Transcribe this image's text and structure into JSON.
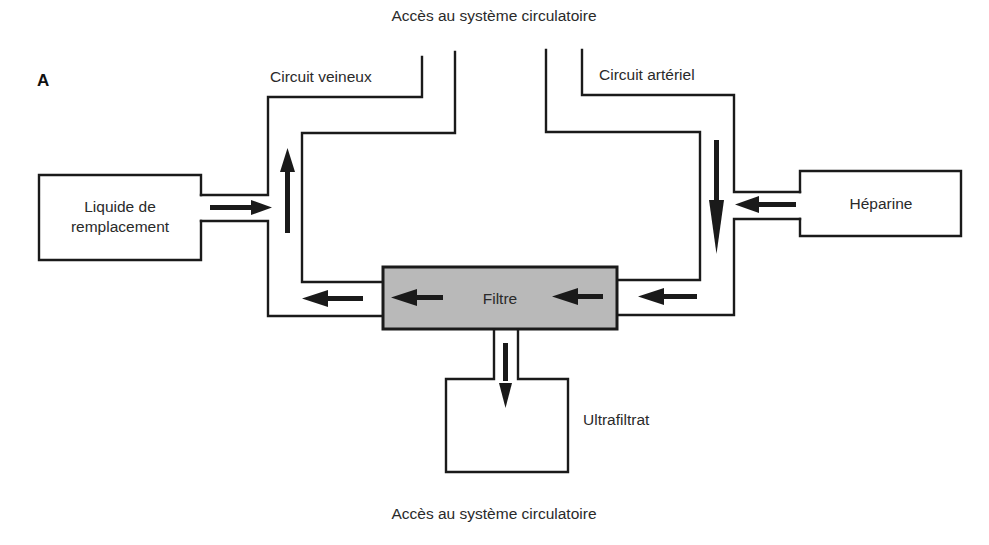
{
  "diagram": {
    "panel_label": "A",
    "labels": {
      "top_access": "Accès au système circulatoire",
      "bottom_access": "Accès au système circulatoire",
      "venous_circuit": "Circuit veineux",
      "arterial_circuit": "Circuit artériel",
      "replacement_fluid_line1": "Liquide de",
      "replacement_fluid_line2": "remplacement",
      "heparin": "Héparine",
      "filter": "Filtre",
      "ultrafiltrate": "Ultrafiltrat"
    },
    "colors": {
      "line": "#1a1a1a",
      "filter_fill": "#b9b9b9",
      "background": "#ffffff"
    },
    "flow": [
      {
        "from": "Accès au système circulatoire",
        "to": "Circuit artériel",
        "direction": "down"
      },
      {
        "from": "Héparine",
        "to": "Circuit artériel",
        "direction": "left"
      },
      {
        "from": "Circuit artériel",
        "to": "Filtre",
        "direction": "left"
      },
      {
        "from": "Filtre",
        "to": "Ultrafiltrat",
        "direction": "down"
      },
      {
        "from": "Filtre",
        "to": "Circuit veineux",
        "direction": "left"
      },
      {
        "from": "Liquide de remplacement",
        "to": "Circuit veineux",
        "direction": "right"
      },
      {
        "from": "Circuit veineux",
        "to": "Accès au système circulatoire",
        "direction": "up"
      }
    ]
  }
}
